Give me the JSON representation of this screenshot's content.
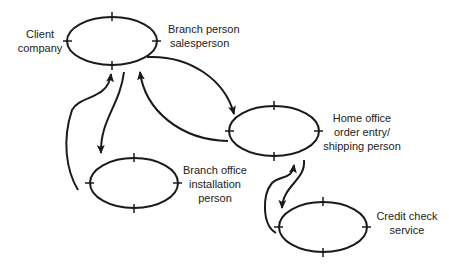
{
  "diagram": {
    "nodes": [
      {
        "id": "client-salesperson",
        "left_label": [
          "Client",
          "company"
        ],
        "right_label": [
          "Branch person",
          "salesperson"
        ]
      },
      {
        "id": "home-office",
        "label": [
          "Home office",
          "order  entry/",
          "shipping  person"
        ]
      },
      {
        "id": "branch-installation",
        "label": [
          "Branch  office",
          "installation",
          "person"
        ]
      },
      {
        "id": "credit-check",
        "label": [
          "Credit check",
          "service"
        ]
      }
    ],
    "edges": [
      {
        "from": "client-salesperson",
        "to": "home-office"
      },
      {
        "from": "home-office",
        "to": "client-salesperson"
      },
      {
        "from": "client-salesperson",
        "to": "branch-installation"
      },
      {
        "from": "branch-installation",
        "to": "client-salesperson"
      },
      {
        "from": "home-office",
        "to": "credit-check"
      },
      {
        "from": "credit-check",
        "to": "home-office"
      }
    ],
    "stroke_color": "#1a1a1a"
  }
}
